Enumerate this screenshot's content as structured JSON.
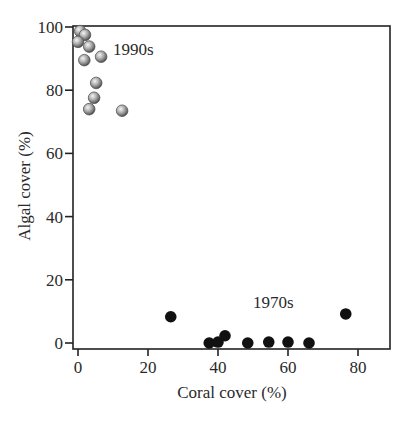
{
  "chart_data": {
    "type": "scatter",
    "title": "",
    "xlabel": "Coral cover (%)",
    "ylabel": "Algal cover (%)",
    "xlim": [
      -1.5,
      89
    ],
    "ylim": [
      -2,
      100
    ],
    "xticks": [
      0,
      20,
      40,
      60,
      80
    ],
    "yticks": [
      0,
      20,
      40,
      60,
      80,
      100
    ],
    "grid": false,
    "legend": "none (inline annotations)",
    "annotations": [
      {
        "text": "1990s",
        "x": 10,
        "y": 91
      },
      {
        "text": "1970s",
        "x": 50,
        "y": 11
      }
    ],
    "series": [
      {
        "name": "1990s",
        "marker": "grey shaded sphere",
        "color": "#9a9a9a",
        "points": [
          {
            "x": 0.6,
            "y": 98.7
          },
          {
            "x": 2.0,
            "y": 97.5
          },
          {
            "x": 0.0,
            "y": 95.3
          },
          {
            "x": 3.2,
            "y": 93.8
          },
          {
            "x": 1.8,
            "y": 89.5
          },
          {
            "x": 6.6,
            "y": 90.6
          },
          {
            "x": 5.2,
            "y": 82.3
          },
          {
            "x": 4.6,
            "y": 77.6
          },
          {
            "x": 3.2,
            "y": 74.0
          },
          {
            "x": 12.6,
            "y": 73.5
          }
        ]
      },
      {
        "name": "1970s",
        "marker": "black filled circle",
        "color": "#111111",
        "points": [
          {
            "x": 26.5,
            "y": 8.3
          },
          {
            "x": 37.5,
            "y": 0.0
          },
          {
            "x": 40.0,
            "y": 0.3
          },
          {
            "x": 42.0,
            "y": 2.3
          },
          {
            "x": 48.5,
            "y": 0.0
          },
          {
            "x": 54.5,
            "y": 0.3
          },
          {
            "x": 60.0,
            "y": 0.3
          },
          {
            "x": 66.0,
            "y": 0.0
          },
          {
            "x": 76.5,
            "y": 9.2
          }
        ]
      }
    ]
  }
}
